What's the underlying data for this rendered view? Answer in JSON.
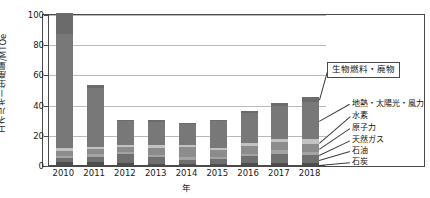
{
  "chart_data": {
    "type": "bar",
    "stacked": true,
    "title": "",
    "xlabel": "年",
    "ylabel": "エネルギー生産量/MTOe",
    "ylim": [
      0,
      100
    ],
    "yticks": [
      0,
      20,
      40,
      60,
      80,
      100
    ],
    "grid": true,
    "legend_position": "right",
    "categories": [
      "2010",
      "2011",
      "2012",
      "2013",
      "2014",
      "2015",
      "2016",
      "2017",
      "2018"
    ],
    "series": [
      {
        "name": "石炭",
        "color": "#4e4e4e",
        "values": [
          2.0,
          2.0,
          1.5,
          1.0,
          1.0,
          1.0,
          1.5,
          1.5,
          1.5
        ]
      },
      {
        "name": "石油",
        "color": "#6f6f6f",
        "values": [
          2.5,
          3.5,
          5.5,
          4.0,
          2.5,
          3.0,
          4.5,
          5.5,
          5.0
        ]
      },
      {
        "name": "天然ガス",
        "color": "#a3a3a3",
        "values": [
          1.5,
          1.5,
          1.5,
          1.5,
          2.0,
          1.5,
          1.5,
          3.0,
          2.0
        ]
      },
      {
        "name": "原子力",
        "color": "#8c8c8c",
        "values": [
          3.0,
          3.5,
          3.5,
          5.0,
          6.5,
          4.5,
          5.0,
          5.0,
          5.5
        ]
      },
      {
        "name": "水素",
        "color": "#c2c2c2",
        "values": [
          2.0,
          1.5,
          1.5,
          1.5,
          1.5,
          1.5,
          2.0,
          2.0,
          3.0
        ]
      },
      {
        "name": "地熱・太陽光・風力",
        "color": "#787878",
        "values": [
          76.0,
          39.0,
          15.5,
          15.5,
          13.5,
          17.5,
          20.0,
          22.0,
          25.0
        ]
      },
      {
        "name": "生物燃料・廃物",
        "color": "#6b6b6b",
        "values": [
          14.0,
          2.0,
          1.0,
          1.5,
          1.0,
          1.0,
          1.5,
          2.0,
          3.0
        ]
      }
    ],
    "totals": [
      101,
      53,
      30,
      30,
      28,
      30,
      36,
      41,
      45
    ]
  },
  "callout": {
    "label": "生物燃料・廃物"
  },
  "legend": {
    "items": [
      {
        "label": "地熱・太陽光・風力"
      },
      {
        "label": "水素"
      },
      {
        "label": "原子力"
      },
      {
        "label": "天然ガス"
      },
      {
        "label": "石油"
      },
      {
        "label": "石炭"
      }
    ]
  }
}
